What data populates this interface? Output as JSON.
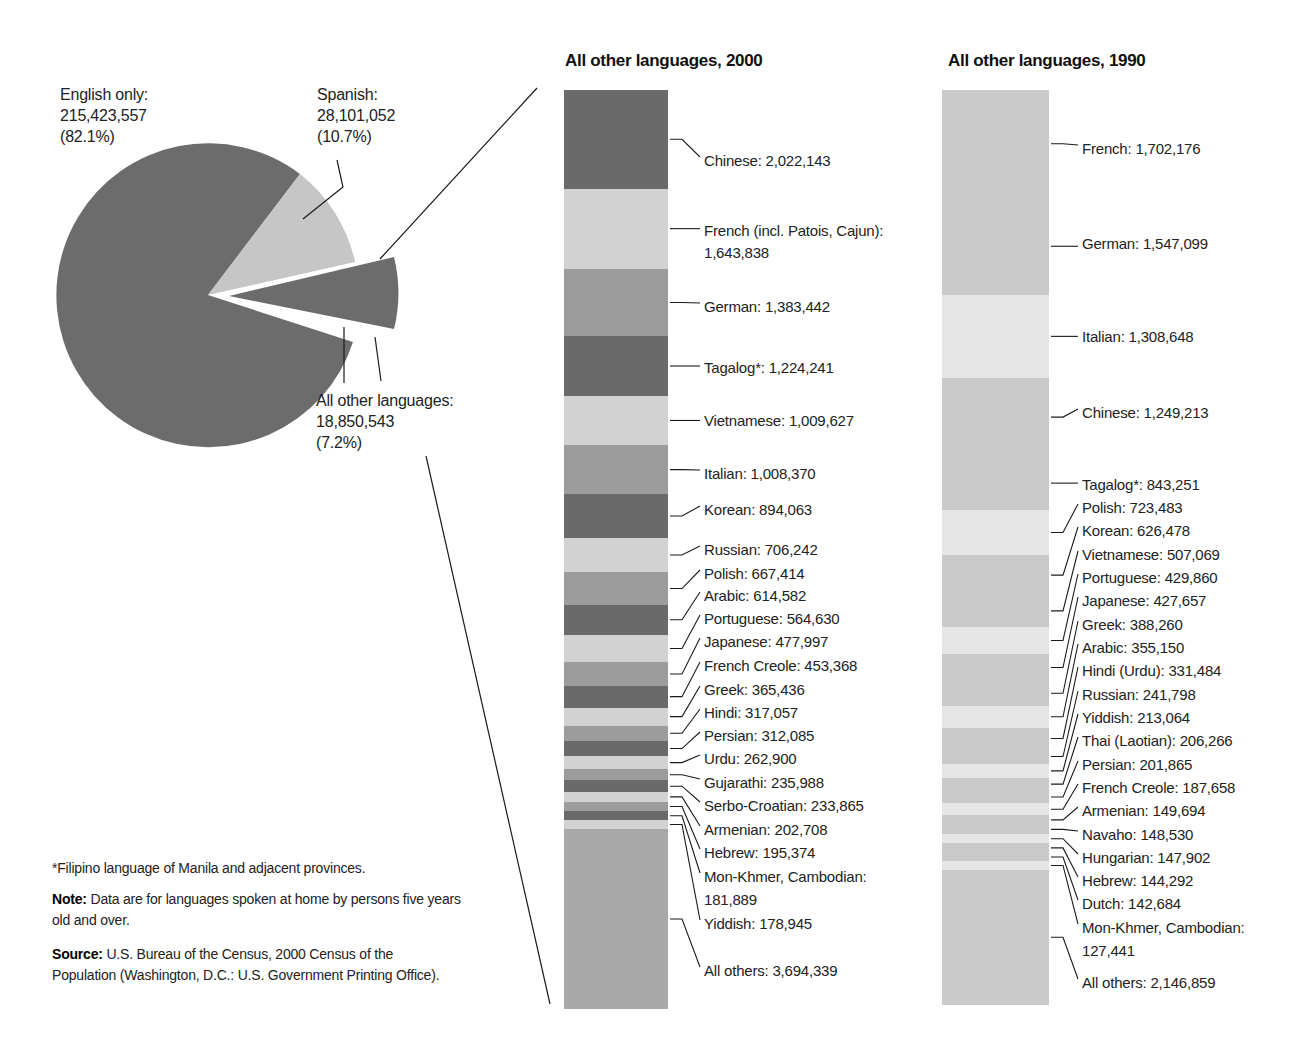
{
  "chart_data": [
    {
      "type": "pie",
      "title": "",
      "categories": [
        "English only",
        "Spanish",
        "All other languages"
      ],
      "values": [
        215423557,
        28101052,
        18850543
      ],
      "percents": [
        82.1,
        10.7,
        7.2
      ],
      "labels": [
        {
          "name": "English only:",
          "value": "215,423,557",
          "pct": "(82.1%)"
        },
        {
          "name": "Spanish:",
          "value": "28,101,052",
          "pct": "(10.7%)"
        },
        {
          "name": "All other languages:",
          "value": "18,850,543",
          "pct": "(7.2%)"
        }
      ],
      "colors": [
        "#6b6b6b",
        "#c4c4c4",
        "#6b6b6b"
      ],
      "exploded": "All other languages"
    },
    {
      "type": "bar",
      "stacked": true,
      "title": "All other languages, 2000",
      "categories": [
        "Chinese",
        "French (incl. Patois, Cajun)",
        "German",
        "Tagalog*",
        "Vietnamese",
        "Italian",
        "Korean",
        "Russian",
        "Polish",
        "Arabic",
        "Portuguese",
        "Japanese",
        "French Creole",
        "Greek",
        "Hindi",
        "Persian",
        "Urdu",
        "Gujarathi",
        "Serbo-Croatian",
        "Armenian",
        "Hebrew",
        "Mon-Khmer, Cambodian",
        "Yiddish",
        "All others"
      ],
      "values": [
        2022143,
        1643838,
        1383442,
        1224241,
        1009627,
        1008370,
        894063,
        706242,
        667414,
        614582,
        564630,
        477997,
        453368,
        365436,
        317057,
        312085,
        262900,
        235988,
        233865,
        202708,
        195374,
        181889,
        178945,
        3694339
      ]
    },
    {
      "type": "bar",
      "stacked": true,
      "title": "All other languages, 1990",
      "categories": [
        "French",
        "German",
        "Italian",
        "Chinese",
        "Tagalog*",
        "Polish",
        "Korean",
        "Vietnamese",
        "Portuguese",
        "Japanese",
        "Greek",
        "Arabic",
        "Hindi (Urdu)",
        "Russian",
        "Yiddish",
        "Thai (Laotian)",
        "Persian",
        "French Creole",
        "Armenian",
        "Navaho",
        "Hungarian",
        "Hebrew",
        "Dutch",
        "Mon-Khmer, Cambodian",
        "All others"
      ],
      "values": [
        1702176,
        1547099,
        1308648,
        1249213,
        843251,
        723483,
        626478,
        507069,
        429860,
        427657,
        388260,
        355150,
        331484,
        241798,
        213064,
        206266,
        201865,
        187658,
        149694,
        148530,
        147902,
        144292,
        142684,
        127441,
        2146859
      ]
    }
  ],
  "pie": {
    "english": {
      "name": "English only:",
      "value": "215,423,557",
      "pct": "(82.1%)"
    },
    "spanish": {
      "name": "Spanish:",
      "value": "28,101,052",
      "pct": "(10.7%)"
    },
    "others": {
      "name": "All other languages:",
      "value": "18,850,543",
      "pct": "(7.2%)"
    }
  },
  "bar2000": {
    "title": "All other languages, 2000",
    "labels": [
      "Chinese: 2,022,143",
      "French (incl. Patois, Cajun):",
      "1,643,838",
      "German: 1,383,442",
      "Tagalog*: 1,224,241",
      "Vietnamese: 1,009,627",
      "Italian: 1,008,370",
      "Korean: 894,063",
      "Russian: 706,242",
      "Polish: 667,414",
      "Arabic: 614,582",
      "Portuguese: 564,630",
      "Japanese: 477,997",
      "French Creole: 453,368",
      "Greek: 365,436",
      "Hindi: 317,057",
      "Persian: 312,085",
      "Urdu: 262,900",
      "Gujarathi: 235,988",
      "Serbo-Croatian: 233,865",
      "Armenian: 202,708",
      "Hebrew: 195,374",
      "Mon-Khmer, Cambodian:",
      "181,889",
      "Yiddish: 178,945",
      "All others: 3,694,339"
    ]
  },
  "bar1990": {
    "title": "All other languages, 1990",
    "labels": [
      "French: 1,702,176",
      "German: 1,547,099",
      "Italian: 1,308,648",
      "Chinese: 1,249,213",
      "Tagalog*: 843,251",
      "Polish: 723,483",
      "Korean: 626,478",
      "Vietnamese: 507,069",
      "Portuguese: 429,860",
      "Japanese: 427,657",
      "Greek: 388,260",
      "Arabic: 355,150",
      "Hindi (Urdu): 331,484",
      "Russian: 241,798",
      "Yiddish: 213,064",
      "Thai (Laotian): 206,266",
      "Persian: 201,865",
      "French Creole: 187,658",
      "Armenian: 149,694",
      "Navaho: 148,530",
      "Hungarian: 147,902",
      "Hebrew: 144,292",
      "Dutch: 142,684",
      "Mon-Khmer, Cambodian:",
      "127,441",
      "All others: 2,146,859"
    ]
  },
  "footnotes": {
    "asterisk": "*Filipino language of Manila and adjacent provinces.",
    "note_label": "Note:",
    "note_text": " Data are for languages spoken at home by persons five years old and over.",
    "source_label": "Source:",
    "source_text": " U.S. Bureau of the Census, 2000 Census of the Population (Washington, D.C.: U.S. Government Printing Office)."
  },
  "colors": {
    "dark": "#6b6b6b",
    "medium": "#999999",
    "light": "#cfcfcf",
    "bar1990_a": "#c8c8c8",
    "bar1990_b": "#e2e2e2",
    "line": "#1a1a1a"
  }
}
